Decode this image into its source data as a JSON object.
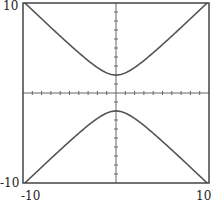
{
  "chart_data": {
    "type": "line",
    "title": "",
    "xlabel": "",
    "ylabel": "",
    "xlim": [
      -10,
      10
    ],
    "ylim": [
      -10,
      10
    ],
    "tick_spacing": 1,
    "grid": false,
    "axes_through_origin": true,
    "series": [
      {
        "name": "upper branch",
        "equation": "y = sqrt(x^2 + 4)",
        "x": [
          -10,
          -8,
          -6,
          -4,
          -2,
          0,
          2,
          4,
          6,
          8,
          10
        ],
        "values": [
          10.2,
          8.25,
          6.32,
          4.47,
          2.83,
          2,
          2.83,
          4.47,
          6.32,
          8.25,
          10.2
        ]
      },
      {
        "name": "lower branch",
        "equation": "y = -sqrt(x^2 + 4)",
        "x": [
          -10,
          -8,
          -6,
          -4,
          -2,
          0,
          2,
          4,
          6,
          8,
          10
        ],
        "values": [
          -10.2,
          -8.25,
          -6.32,
          -4.47,
          -2.83,
          -2,
          -2.83,
          -4.47,
          -6.32,
          -8.25,
          -10.2
        ]
      }
    ],
    "line_color": "#555555"
  },
  "labels": {
    "y_max": "10",
    "y_min": "-10",
    "x_min": "-10",
    "x_max": "10"
  }
}
